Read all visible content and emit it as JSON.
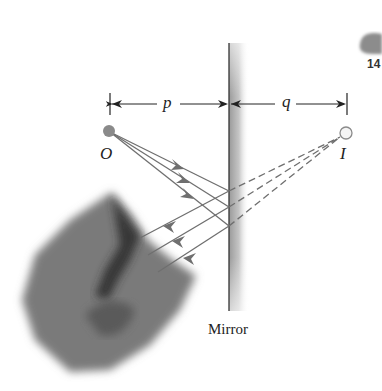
{
  "figure": {
    "labels": {
      "object": "O",
      "image": "I",
      "object_distance": "p",
      "image_distance": "q",
      "mirror": "Mirror"
    },
    "corner_badge": {
      "text": "14"
    },
    "colors": {
      "ray": "#6f6f6f",
      "object_dot": "#8a8a8a",
      "image_dot_fill": "#f4f4f4",
      "image_dot_stroke": "#8a8a8a",
      "mirror_line": "#333333",
      "mirror_shade": "#c8c8c8",
      "dimension_line": "#222222"
    },
    "geometry": {
      "object_point": [
        109,
        131
      ],
      "image_point": [
        346,
        133
      ],
      "mirror_x": 229,
      "mirror_y_range": [
        43,
        311
      ],
      "reflection_points_y": [
        191,
        207,
        226
      ]
    }
  }
}
